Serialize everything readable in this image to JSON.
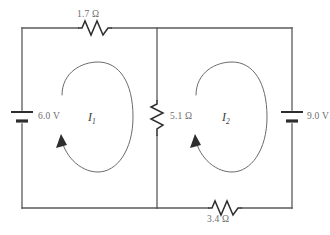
{
  "diagram": {
    "background_color": "#ffffff",
    "wire_color": "#5a5a5a",
    "label_color": "#6e6e6e",
    "component_color": "#2e2e2e"
  },
  "components": {
    "top_resistor": {
      "name": "top-resistor",
      "label": "1.7 Ω",
      "value": 1.7,
      "unit": "Ω",
      "orientation": "horizontal",
      "position": "top-left-branch"
    },
    "middle_resistor": {
      "name": "middle-resistor",
      "label": "5.1 Ω",
      "value": 5.1,
      "unit": "Ω",
      "orientation": "vertical",
      "position": "center-branch"
    },
    "bottom_resistor": {
      "name": "bottom-resistor",
      "label": "3.4 Ω",
      "value": 3.4,
      "unit": "Ω",
      "orientation": "horizontal",
      "position": "bottom-right-branch"
    },
    "left_battery": {
      "name": "left-battery",
      "label": "6.0 V",
      "value": 6.0,
      "unit": "V",
      "orientation": "vertical",
      "position": "left-branch"
    },
    "right_battery": {
      "name": "right-battery",
      "label": "9.0 V",
      "value": 9.0,
      "unit": "V",
      "orientation": "vertical",
      "position": "right-branch"
    }
  },
  "currents": [
    {
      "name": "mesh-current-1",
      "symbol": "I",
      "subscript": "1",
      "direction": "counterclockwise",
      "loop": "left"
    },
    {
      "name": "mesh-current-2",
      "symbol": "I",
      "subscript": "2",
      "direction": "counterclockwise",
      "loop": "right"
    }
  ]
}
